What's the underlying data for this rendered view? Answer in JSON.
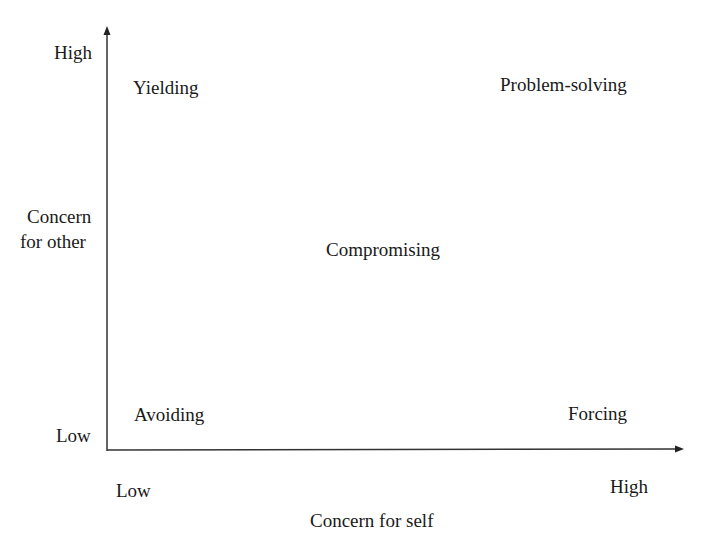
{
  "diagram": {
    "type": "2x2 conflict style grid",
    "y_axis": {
      "label_line1": "Concern",
      "label_line2": "for other",
      "high": "High",
      "low": "Low"
    },
    "x_axis": {
      "label": "Concern for self",
      "high": "High",
      "low": "Low"
    },
    "styles": {
      "top_left": "Yielding",
      "top_right": "Problem-solving",
      "center": "Compromising",
      "bottom_left": "Avoiding",
      "bottom_right": "Forcing"
    },
    "colors": {
      "text": "#1a1a1a",
      "axis": "#333333",
      "background": "#ffffff"
    }
  }
}
